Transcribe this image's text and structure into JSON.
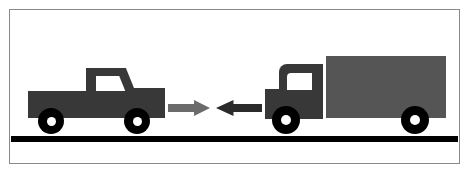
{
  "scene": {
    "title": "Two vehicles approaching head-on on a road",
    "width": 470,
    "height": 175,
    "background_color": "#ffffff",
    "border_color": "#8a8a8a"
  },
  "road": {
    "label": "road",
    "color": "#000000"
  },
  "vehicles": [
    {
      "id": "pickup-truck",
      "label": "Pickup truck",
      "facing": "right",
      "body_color": "#383838",
      "window_color": "#ffffff",
      "wheel_color": "#000000",
      "hub_color": "#ffffff",
      "wheel_count": 2
    },
    {
      "id": "box-truck",
      "label": "Box truck",
      "facing": "left",
      "body_color": "#383838",
      "cargo_box_color": "#555555",
      "window_color": "#ffffff",
      "wheel_color": "#000000",
      "hub_color": "#ffffff",
      "wheel_count": 2
    }
  ],
  "arrows": [
    {
      "id": "arrow-right",
      "label": "Rightward motion arrow",
      "direction": "right",
      "color": "#6b6b6b"
    },
    {
      "id": "arrow-left",
      "label": "Leftward motion arrow",
      "direction": "left",
      "color": "#2b2b2b"
    }
  ]
}
